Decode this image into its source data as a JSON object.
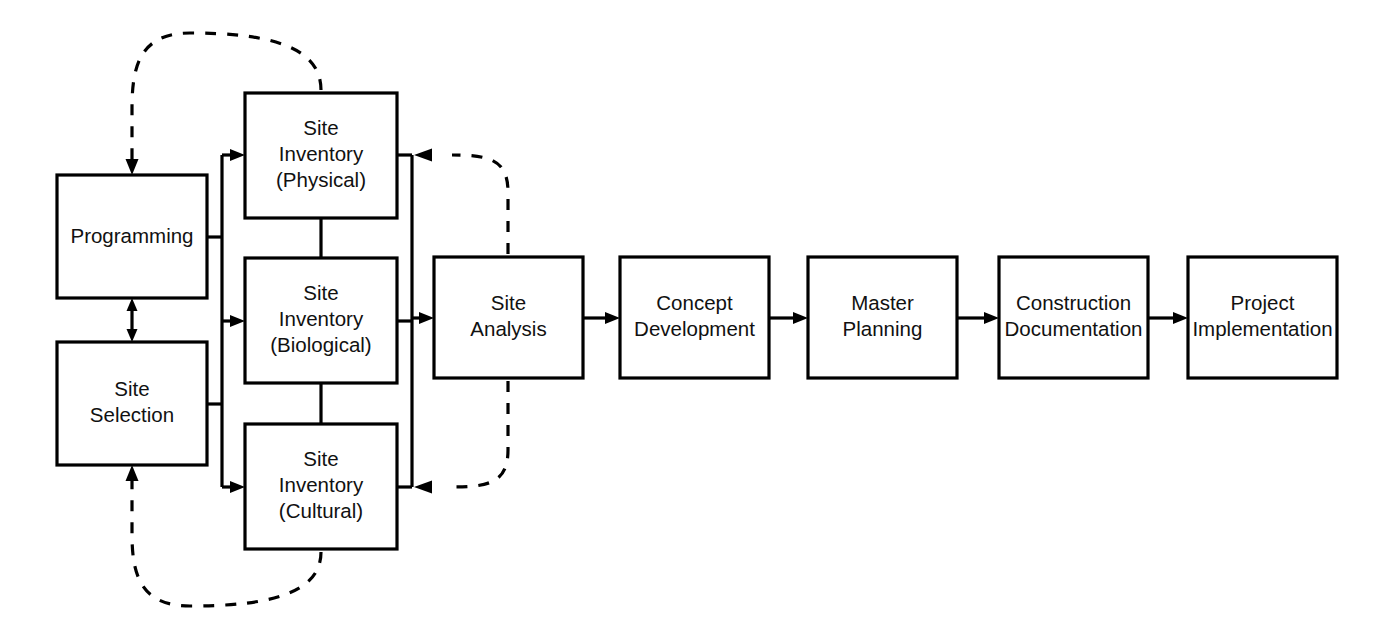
{
  "diagram": {
    "type": "process-flowchart",
    "background_color": "#ffffff",
    "line_color": "#000000",
    "text_color": "#111111",
    "nodes": [
      {
        "id": "programming",
        "label_lines": [
          "Programming"
        ],
        "line1": "Programming",
        "line2": "",
        "line3": "",
        "x": 57,
        "y": 175,
        "w": 150,
        "h": 123
      },
      {
        "id": "site-selection",
        "label_lines": [
          "Site",
          "Selection"
        ],
        "line1": "Site",
        "line2": "Selection",
        "line3": "",
        "x": 57,
        "y": 342,
        "w": 150,
        "h": 123
      },
      {
        "id": "site-inventory-physical",
        "label_lines": [
          "Site",
          "Inventory",
          "(Physical)"
        ],
        "line1": "Site",
        "line2": "Inventory",
        "line3": "(Physical)",
        "x": 245,
        "y": 93,
        "w": 152,
        "h": 125
      },
      {
        "id": "site-inventory-biological",
        "label_lines": [
          "Site",
          "Inventory",
          "(Biological)"
        ],
        "line1": "Site",
        "line2": "Inventory",
        "line3": "(Biological)",
        "x": 245,
        "y": 258,
        "w": 152,
        "h": 125
      },
      {
        "id": "site-inventory-cultural",
        "label_lines": [
          "Site",
          "Inventory",
          "(Cultural)"
        ],
        "line1": "Site",
        "line2": "Inventory",
        "line3": "(Cultural)",
        "x": 245,
        "y": 424,
        "w": 152,
        "h": 125
      },
      {
        "id": "site-analysis",
        "label_lines": [
          "Site",
          "Analysis"
        ],
        "line1": "Site",
        "line2": "Analysis",
        "line3": "",
        "x": 434,
        "y": 257,
        "w": 149,
        "h": 121
      },
      {
        "id": "concept-development",
        "label_lines": [
          "Concept",
          "Development"
        ],
        "line1": "Concept",
        "line2": "Development",
        "line3": "",
        "x": 620,
        "y": 257,
        "w": 149,
        "h": 121
      },
      {
        "id": "master-planning",
        "label_lines": [
          "Master",
          "Planning"
        ],
        "line1": "Master",
        "line2": "Planning",
        "line3": "",
        "x": 808,
        "y": 257,
        "w": 149,
        "h": 121
      },
      {
        "id": "construction-documentation",
        "label_lines": [
          "Construction",
          "Documentation"
        ],
        "line1": "Construction",
        "line2": "Documentation",
        "line3": "",
        "x": 999,
        "y": 257,
        "w": 149,
        "h": 121
      },
      {
        "id": "project-implementation",
        "label_lines": [
          "Project",
          "Implementation"
        ],
        "line1": "Project",
        "line2": "Implementation",
        "line3": "",
        "x": 1188,
        "y": 257,
        "w": 149,
        "h": 121
      }
    ],
    "connections": [
      {
        "id": "programming-to-site-selection",
        "style": "solid",
        "kind": "bidirectional-vertical"
      },
      {
        "id": "left-bus-to-inventories",
        "style": "solid",
        "kind": "fan-out"
      },
      {
        "id": "physical-to-biological",
        "style": "solid",
        "kind": "vertical-link"
      },
      {
        "id": "biological-to-cultural",
        "style": "solid",
        "kind": "vertical-link"
      },
      {
        "id": "inventories-to-site-analysis",
        "style": "solid",
        "kind": "merge"
      },
      {
        "id": "site-analysis-to-concept-development",
        "style": "solid",
        "kind": "arrow"
      },
      {
        "id": "concept-development-to-master-planning",
        "style": "solid",
        "kind": "arrow"
      },
      {
        "id": "master-planning-to-construction-documentation",
        "style": "solid",
        "kind": "arrow"
      },
      {
        "id": "construction-documentation-to-project-implementation",
        "style": "solid",
        "kind": "arrow"
      },
      {
        "id": "physical-feedback-to-programming",
        "style": "dashed",
        "kind": "feedback-loop-top"
      },
      {
        "id": "site-analysis-feedback-to-physical",
        "style": "dashed",
        "kind": "feedback-loop-upper-right"
      },
      {
        "id": "site-analysis-feedback-to-cultural",
        "style": "dashed",
        "kind": "feedback-loop-lower-right"
      },
      {
        "id": "cultural-feedback-to-site-selection",
        "style": "dashed",
        "kind": "feedback-loop-bottom"
      }
    ]
  }
}
